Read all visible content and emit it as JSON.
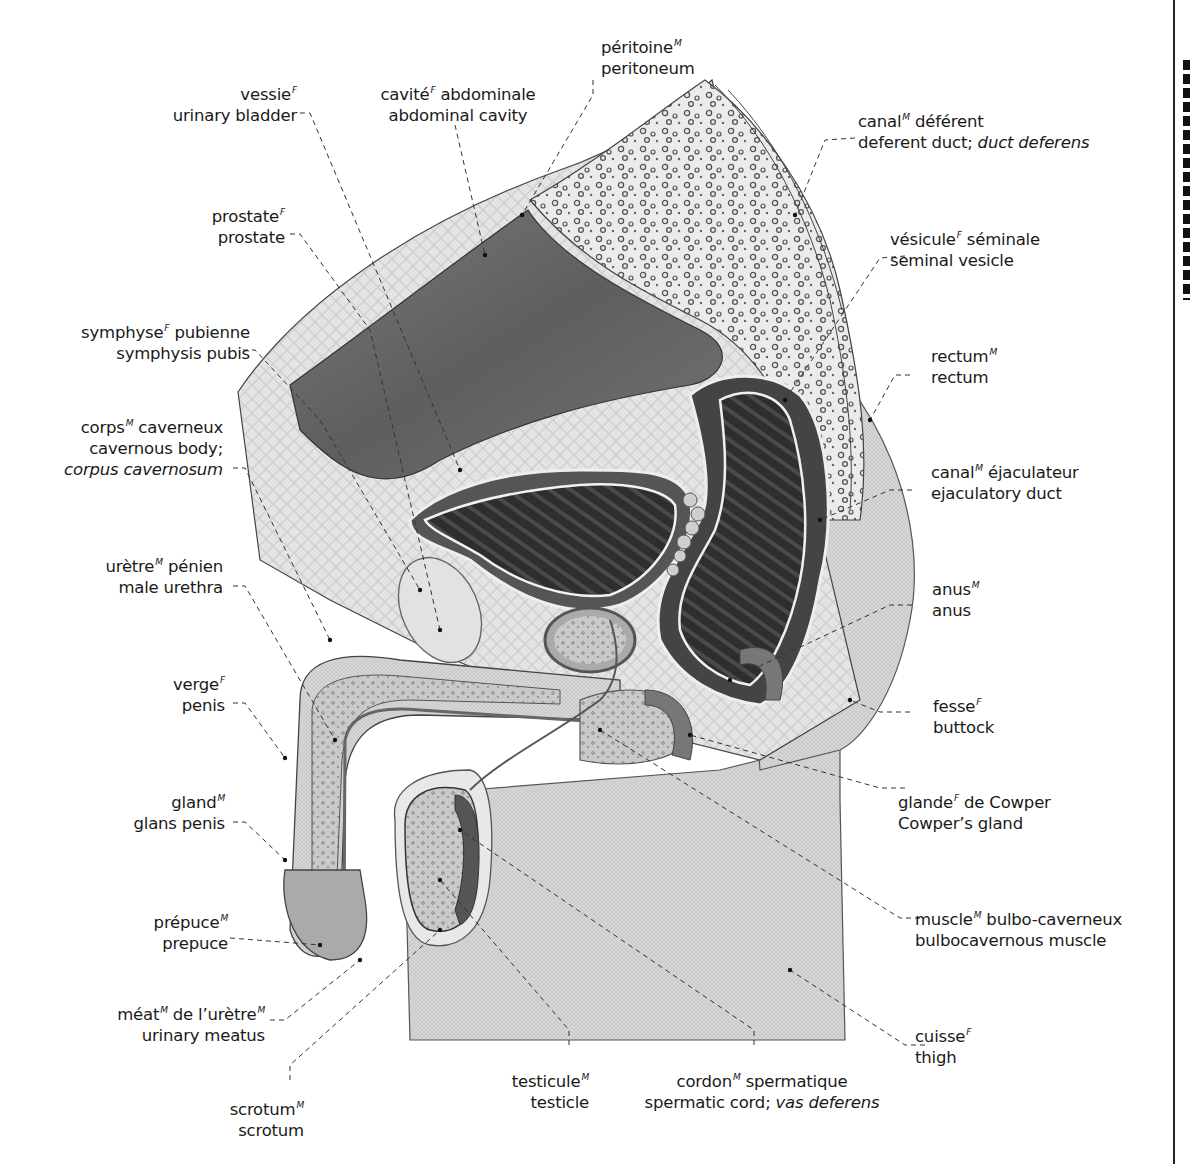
{
  "diagram": {
    "palette": {
      "skin": "#d9d9d9",
      "cavity": "#6e6e6e",
      "dark_lumen": "#2f2f2f",
      "bone": "#ececec",
      "tissue": "#bdbdbd",
      "outline": "#3a3a3a",
      "leader": "#333333"
    }
  },
  "labels": {
    "vessie": {
      "fr": "vessie",
      "g": "F",
      "en": "urinary bladder"
    },
    "cavite": {
      "fr": "cavité",
      "g": "F",
      "fr2": " abdominale",
      "en": "abdominal cavity"
    },
    "peritoine": {
      "fr": "péritoine",
      "g": "M",
      "en": "peritoneum"
    },
    "canal_def": {
      "fr": "canal",
      "g": "M",
      "fr2": " déférent",
      "en": "deferent duct; ",
      "en_it": "duct deferens"
    },
    "prostate": {
      "fr": "prostate",
      "g": "F",
      "en": "prostate"
    },
    "vesicule": {
      "fr": "vésicule",
      "g": "F",
      "fr2": " séminale",
      "en": "seminal vesicle"
    },
    "symphyse": {
      "fr": "symphyse",
      "g": "F",
      "fr2": " pubienne",
      "en": "symphysis pubis"
    },
    "rectum": {
      "fr": "rectum",
      "g": "M",
      "en": "rectum"
    },
    "corps": {
      "fr": "corps",
      "g": "M",
      "fr2": " caverneux",
      "en": "cavernous body;",
      "en_it": "corpus cavernosum"
    },
    "canal_ejac": {
      "fr": "canal",
      "g": "M",
      "fr2": " éjaculateur",
      "en": "ejaculatory duct"
    },
    "uretre": {
      "fr": "urètre",
      "g": "M",
      "fr2": " pénien",
      "en": "male urethra"
    },
    "anus": {
      "fr": "anus",
      "g": "M",
      "en": "anus"
    },
    "verge": {
      "fr": "verge",
      "g": "F",
      "en": "penis"
    },
    "fesse": {
      "fr": "fesse",
      "g": "F",
      "en": "buttock"
    },
    "gland": {
      "fr": "gland",
      "g": "M",
      "en": "glans penis"
    },
    "cowper": {
      "fr": "glande",
      "g": "F",
      "fr2": " de Cowper",
      "en": "Cowper’s gland"
    },
    "prepuce": {
      "fr": "prépuce",
      "g": "M",
      "en": "prepuce"
    },
    "muscle": {
      "fr": "muscle",
      "g": "M",
      "fr2": " bulbo-caverneux",
      "en": "bulbocavernous muscle"
    },
    "meat": {
      "fr": "méat",
      "g": "M",
      "fr2": " de l’urètre",
      "g2": "M",
      "en": "urinary meatus"
    },
    "cuisse": {
      "fr": "cuisse",
      "g": "F",
      "en": "thigh"
    },
    "scrotum": {
      "fr": "scrotum",
      "g": "M",
      "en": "scrotum"
    },
    "testicule": {
      "fr": "testicule",
      "g": "M",
      "en": "testicle"
    },
    "cordon": {
      "fr": "cordon",
      "g": "M",
      "fr2": " spermatique",
      "en": "spermatic cord; ",
      "en_it": "vas deferens"
    }
  }
}
